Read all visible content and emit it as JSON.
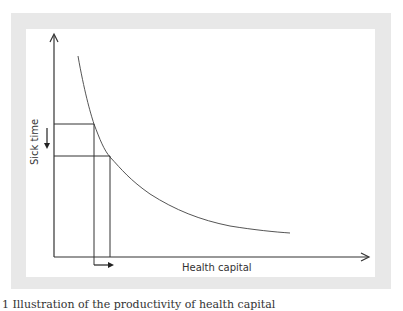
{
  "figure": {
    "caption": "1 Illustration of the productivity of health capital",
    "y_axis_label": "Sick time",
    "x_axis_label": "Health capital",
    "colors": {
      "panel_border": "#e8e8e8",
      "background": "#ffffff",
      "line": "#444444"
    }
  },
  "diagram": {
    "type": "conceptual-curve",
    "curve": "downward-sloping convex curve",
    "elements": [
      "Y axis: Sick time",
      "X axis: Health capital",
      "Two horizontal reference lines from curve to y-axis",
      "Two vertical reference lines from curve to x-axis",
      "Down arrow beside y-axis indicating reduced sick time",
      "Right arrow below x-axis indicating increased health capital"
    ]
  }
}
